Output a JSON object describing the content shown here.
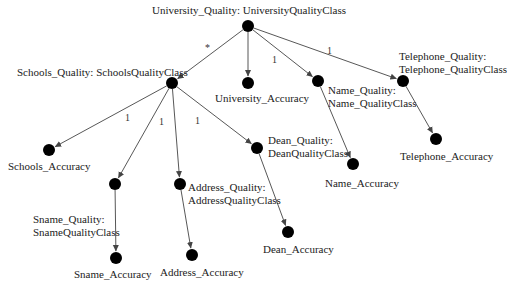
{
  "diagram": {
    "nodes": [
      {
        "id": "root",
        "x": 248,
        "y": 26,
        "label": "University_Quality: UniversityQualityClass",
        "lx": 152,
        "ly": 4
      },
      {
        "id": "schools",
        "x": 172,
        "y": 83,
        "label": "Schools_Quality: SchoolsQualityClass",
        "lx": 17,
        "ly": 66
      },
      {
        "id": "univ_acc",
        "x": 248,
        "y": 83,
        "label": "University_Accuracy",
        "lx": 215,
        "ly": 92
      },
      {
        "id": "name",
        "x": 318,
        "y": 81,
        "label_lines": [
          "Name_Quality:",
          "Name_QualityClass"
        ],
        "lx": 328,
        "ly": 84
      },
      {
        "id": "tel",
        "x": 403,
        "y": 81,
        "label_lines": [
          "Telephone_Quality:",
          "Telephone_QualityClass"
        ],
        "lx": 399,
        "ly": 50
      },
      {
        "id": "schools_acc",
        "x": 49,
        "y": 150,
        "label": "Schools_Accuracy",
        "lx": 8,
        "ly": 160
      },
      {
        "id": "sname",
        "x": 115,
        "y": 184,
        "label_lines": [
          "Sname_Quality:",
          "SnameQualityClass"
        ],
        "lx": 33,
        "ly": 213
      },
      {
        "id": "address",
        "x": 180,
        "y": 184,
        "label_lines": [
          "Address_Quality:",
          "AddressQualityClass"
        ],
        "lx": 188,
        "ly": 181
      },
      {
        "id": "dean",
        "x": 257,
        "y": 148,
        "label_lines": [
          "Dean_Quality:",
          "DeanQualityClass"
        ],
        "lx": 268,
        "ly": 134
      },
      {
        "id": "name_acc",
        "x": 353,
        "y": 164,
        "label": "Name_Accuracy",
        "lx": 325,
        "ly": 177
      },
      {
        "id": "tel_acc",
        "x": 436,
        "y": 139,
        "label": "Telephone_Accuracy",
        "lx": 400,
        "ly": 150
      },
      {
        "id": "sname_acc",
        "x": 116,
        "y": 258,
        "label": "Sname_Accuracy",
        "lx": 74,
        "ly": 268
      },
      {
        "id": "address_acc",
        "x": 192,
        "y": 255,
        "label": "Address_Accuracy",
        "lx": 160,
        "ly": 266
      },
      {
        "id": "dean_acc",
        "x": 288,
        "y": 232,
        "label": "Dean_Accuracy",
        "lx": 263,
        "ly": 243
      }
    ],
    "edges": [
      {
        "from": "root",
        "to": "schools",
        "mult": "*",
        "mx": 205,
        "my": 42
      },
      {
        "from": "root",
        "to": "univ_acc"
      },
      {
        "from": "root",
        "to": "name",
        "mult": "1",
        "mx": 272,
        "my": 54
      },
      {
        "from": "root",
        "to": "tel",
        "mult": "1",
        "mx": 327,
        "my": 45
      },
      {
        "from": "schools",
        "to": "schools_acc",
        "mult": "1",
        "mx": 125,
        "my": 112
      },
      {
        "from": "schools",
        "to": "sname",
        "mult": "1",
        "mx": 159,
        "my": 116
      },
      {
        "from": "schools",
        "to": "address"
      },
      {
        "from": "schools",
        "to": "dean",
        "mult": "1",
        "mx": 195,
        "my": 115
      },
      {
        "from": "name",
        "to": "name_acc"
      },
      {
        "from": "tel",
        "to": "tel_acc"
      },
      {
        "from": "sname",
        "to": "sname_acc"
      },
      {
        "from": "address",
        "to": "address_acc"
      },
      {
        "from": "dean",
        "to": "dean_acc"
      }
    ],
    "node_radius": 6,
    "node_color": "#000000",
    "edge_color": "#444444"
  }
}
